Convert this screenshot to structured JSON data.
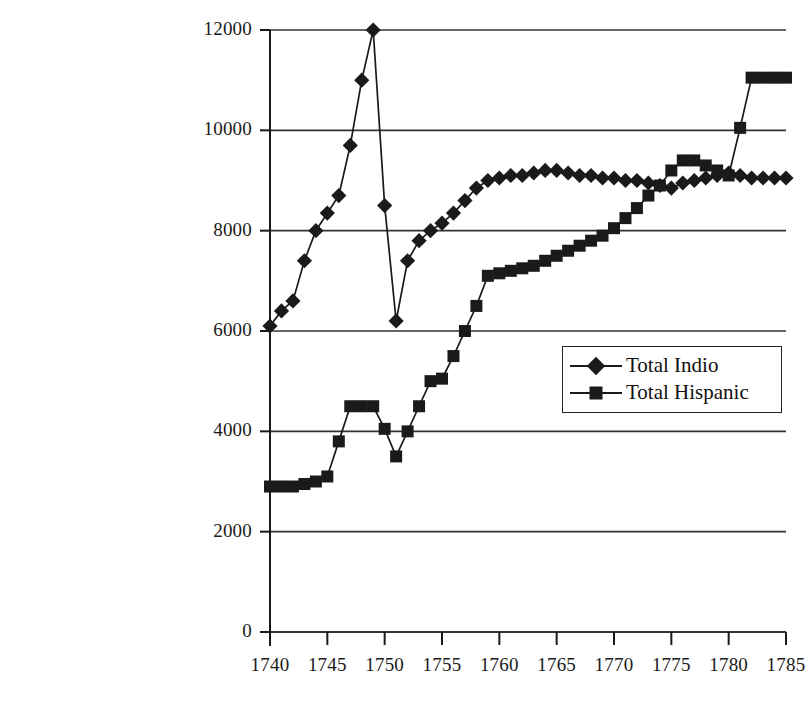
{
  "chart_data": {
    "type": "line",
    "title": "",
    "subtitle": "",
    "xlabel": "",
    "ylabel": "",
    "xlim": [
      1740,
      1785
    ],
    "ylim": [
      0,
      12000
    ],
    "ytick_labels": [
      "0",
      "2000",
      "4000",
      "6000",
      "8000",
      "10000",
      "12000"
    ],
    "ytick_values": [
      0,
      2000,
      4000,
      6000,
      8000,
      10000,
      12000
    ],
    "xtick_labels": [
      "1740",
      "1745",
      "1750",
      "1755",
      "1760",
      "1765",
      "1770",
      "1775",
      "1780",
      "1785"
    ],
    "xtick_values": [
      1740,
      1745,
      1750,
      1755,
      1760,
      1765,
      1770,
      1775,
      1780,
      1785
    ],
    "grid": "horizontal",
    "legend_position": "center-right",
    "line_color": "#1a1a1a",
    "marker_color": "#1a1a1a",
    "axis_color": "#1a1a1a",
    "grid_color": "#333333",
    "background": "#ffffff",
    "x": [
      1740,
      1741,
      1742,
      1743,
      1744,
      1745,
      1746,
      1747,
      1748,
      1749,
      1750,
      1751,
      1752,
      1753,
      1754,
      1755,
      1756,
      1757,
      1758,
      1759,
      1760,
      1761,
      1762,
      1763,
      1764,
      1765,
      1766,
      1767,
      1768,
      1769,
      1770,
      1771,
      1772,
      1773,
      1774,
      1775,
      1776,
      1777,
      1778,
      1779,
      1780,
      1781,
      1782,
      1783,
      1784,
      1785
    ],
    "series": [
      {
        "name": "Total Indio",
        "marker": "diamond",
        "values": [
          6100,
          6400,
          6600,
          7400,
          8000,
          8350,
          8700,
          9700,
          11000,
          12000,
          8500,
          6200,
          7400,
          7800,
          8000,
          8150,
          8350,
          8600,
          8850,
          9000,
          9050,
          9100,
          9100,
          9150,
          9200,
          9200,
          9150,
          9100,
          9100,
          9050,
          9050,
          9000,
          9000,
          8950,
          8900,
          8850,
          8950,
          9000,
          9050,
          9100,
          9150,
          9100,
          9050,
          9050,
          9050,
          9050
        ]
      },
      {
        "name": "Total Hispanic",
        "marker": "square",
        "values": [
          2900,
          2900,
          2900,
          2950,
          3000,
          3100,
          3800,
          4500,
          4500,
          4500,
          4050,
          3500,
          4000,
          4500,
          5000,
          5050,
          5500,
          6000,
          6500,
          7100,
          7150,
          7200,
          7250,
          7300,
          7400,
          7500,
          7600,
          7700,
          7800,
          7900,
          8050,
          8250,
          8450,
          8700,
          8900,
          9200,
          9400,
          9400,
          9300,
          9200,
          9100,
          10050,
          11050,
          11050,
          11050,
          11050
        ]
      }
    ]
  },
  "legend": {
    "items": [
      {
        "label": "Total Indio",
        "marker": "diamond"
      },
      {
        "label": "Total Hispanic",
        "marker": "square"
      }
    ]
  }
}
